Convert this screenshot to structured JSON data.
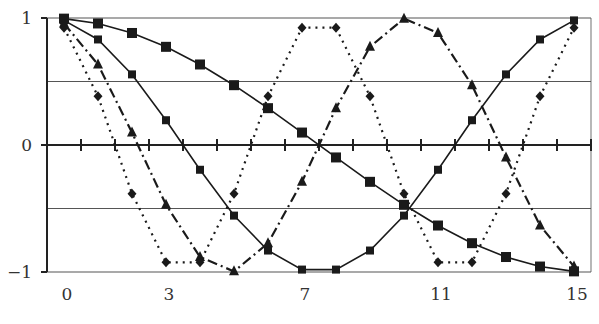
{
  "chart_data": {
    "type": "line",
    "title": "",
    "xlabel": "",
    "ylabel": "",
    "ylim": [
      -1,
      1
    ],
    "grid": true,
    "x": [
      0,
      1,
      2,
      3,
      4,
      5,
      6,
      7,
      8,
      9,
      10,
      11,
      12,
      13,
      14,
      15
    ],
    "x_tick_labels": [
      "0",
      "3",
      "7",
      "11",
      "15"
    ],
    "x_tick_label_positions": [
      0,
      3,
      7,
      11,
      15
    ],
    "y_tick_labels": [
      "1",
      "0",
      "−1"
    ],
    "y_tick_values": [
      1,
      0,
      -1
    ],
    "y_gridlines": [
      1,
      0.5,
      0,
      -0.5,
      -1
    ],
    "series": [
      {
        "name": "k=1",
        "marker": "square-large",
        "line_style": "solid",
        "values": [
          0.995,
          0.957,
          0.882,
          0.773,
          0.634,
          0.471,
          0.29,
          0.098,
          -0.098,
          -0.29,
          -0.471,
          -0.634,
          -0.773,
          -0.882,
          -0.957,
          -0.995
        ]
      },
      {
        "name": "k=2",
        "marker": "square-small",
        "line_style": "solid",
        "values": [
          0.981,
          0.831,
          0.556,
          0.195,
          -0.195,
          -0.556,
          -0.831,
          -0.981,
          -0.981,
          -0.831,
          -0.556,
          -0.195,
          0.195,
          0.556,
          0.831,
          0.981
        ]
      },
      {
        "name": "k=3",
        "marker": "triangle",
        "line_style": "dash-dot",
        "values": [
          0.957,
          0.634,
          0.098,
          -0.471,
          -0.882,
          -0.995,
          -0.773,
          -0.29,
          0.29,
          0.773,
          0.995,
          0.882,
          0.471,
          -0.098,
          -0.634,
          -0.957
        ]
      },
      {
        "name": "k=4",
        "marker": "diamond",
        "line_style": "dotted",
        "values": [
          0.924,
          0.383,
          -0.383,
          -0.924,
          -0.924,
          -0.383,
          0.383,
          0.924,
          0.924,
          0.383,
          -0.383,
          -0.924,
          -0.924,
          -0.383,
          0.383,
          0.924
        ]
      }
    ],
    "colors": {
      "line": "#1a1a1a",
      "grid": "#555555",
      "text": "#333333",
      "background": "#ffffff"
    }
  }
}
